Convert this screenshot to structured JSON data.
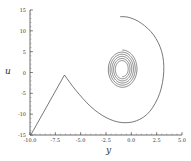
{
  "chart_data": {
    "type": "line",
    "title": "",
    "xlabel": "y",
    "ylabel": "u",
    "xlim": [
      -10,
      5
    ],
    "ylim": [
      -15,
      15
    ],
    "xticks": [
      "-10.0",
      "-7.5",
      "-5.0",
      "-2.5",
      "0.0",
      "2.5",
      "5.0"
    ],
    "xtick_values": [
      -10,
      -7.5,
      -5,
      -2.5,
      0,
      2.5,
      5
    ],
    "yticks": [
      "15",
      "10",
      "5",
      "0",
      "-5",
      "-10",
      "-15"
    ],
    "ytick_values": [
      15,
      10,
      5,
      0,
      -5,
      -10,
      -15
    ],
    "grid": false,
    "legend": null,
    "line_color": "#555555",
    "series": [
      {
        "name": "trajectory",
        "x": [
          -9.9,
          -6.6,
          -5.5,
          -4.0,
          -2.5,
          -1.0,
          0.5,
          1.8,
          2.8,
          3.2,
          3.0,
          2.2,
          1.0,
          -0.2,
          -1.1
        ],
        "y": [
          -14.9,
          -0.6,
          -4.2,
          -8.2,
          -10.8,
          -12.0,
          -11.6,
          -9.4,
          -5.0,
          0.2,
          5.0,
          9.0,
          11.8,
          13.2,
          13.4
        ]
      },
      {
        "name": "spiral",
        "center": [
          -0.9,
          0.8
        ],
        "start": [
          -0.9,
          5.2
        ],
        "turns": 5.5,
        "outer_radius": [
          1.5,
          4.6
        ],
        "inner_radius": [
          0.55,
          1.8
        ]
      }
    ]
  }
}
